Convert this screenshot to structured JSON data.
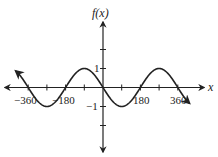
{
  "chart_data": {
    "type": "line",
    "title": "",
    "xlabel": "x",
    "ylabel": "f(x)",
    "function": "f(x) = -sin(x)",
    "x_ticks": [
      -360,
      -180,
      180,
      360
    ],
    "x_tick_labels": [
      "−360",
      "−180",
      "180",
      "360"
    ],
    "y_tick_labels": [
      "1",
      "−1"
    ],
    "xlim": [
      -450,
      450
    ],
    "ylim": [
      -3,
      3
    ],
    "grid": false,
    "series": [
      {
        "name": "f(x)",
        "x": [
          -420,
          -360,
          -270,
          -180,
          -90,
          0,
          90,
          180,
          270,
          360,
          420
        ],
        "values": [
          -0.87,
          0,
          -1,
          0,
          1,
          0,
          -1,
          0,
          1,
          0,
          -0.87
        ]
      }
    ]
  },
  "labels": {
    "y_axis": "f(x)",
    "x_axis": "x",
    "x_neg360": "−360",
    "x_neg180": "−180",
    "x_180": "180",
    "x_360": "360",
    "y_1": "1",
    "y_neg1": "−1"
  }
}
